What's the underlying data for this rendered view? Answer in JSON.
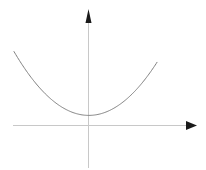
{
  "figure": {
    "title": "",
    "background_color": "#ffffff",
    "width": 206,
    "height": 170
  },
  "chart_data": {
    "type": "line",
    "title": "",
    "xlabel": "",
    "ylabel": "",
    "grid": false,
    "legend": null,
    "function": "y = a(x - h)^2 + k",
    "vertex": {
      "x_px": 87,
      "y_px": 117
    },
    "origin_px": {
      "x": 88,
      "y": 125
    },
    "axis_of_symmetry_px": 86,
    "x": [
      14,
      22,
      30,
      38,
      46,
      54,
      62,
      70,
      78,
      86,
      94,
      102,
      110,
      118,
      126,
      134,
      142,
      150,
      157
    ],
    "y": [
      57,
      66,
      75,
      83,
      91,
      98,
      105,
      110,
      114,
      117,
      117,
      115,
      112,
      107,
      101,
      94,
      85,
      72,
      57
    ],
    "x_px_range": [
      14,
      157
    ],
    "y_px_range": [
      57,
      117
    ],
    "series": [
      {
        "name": "parabola",
        "color": "#808080",
        "line_width": 1,
        "values": [
          57,
          66,
          75,
          83,
          91,
          98,
          105,
          110,
          114,
          117,
          117,
          115,
          112,
          107,
          101,
          94,
          85,
          72,
          57
        ]
      }
    ]
  },
  "axes": {
    "x_axis": {
      "label": "",
      "color": "#c8c8c8",
      "line_width": 1,
      "start_px": {
        "x": 13,
        "y": 125
      },
      "end_px": {
        "x": 189,
        "y": 125
      },
      "arrow": {
        "name": "x-axis-arrowhead",
        "direction": "right",
        "color": "#1a1a1a",
        "tip_px": {
          "x": 197,
          "y": 125
        }
      }
    },
    "y_axis": {
      "label": "",
      "color": "#c8c8c8",
      "line_width": 1,
      "start_px": {
        "x": 88,
        "y": 168
      },
      "end_px": {
        "x": 88,
        "y": 22
      },
      "arrow": {
        "name": "y-axis-arrowhead",
        "direction": "up",
        "color": "#1a1a1a",
        "tip_px": {
          "x": 88,
          "y": 9
        }
      }
    }
  },
  "colors": {
    "curve": "#808080",
    "axis": "#c8c8c8",
    "arrow": "#1a1a1a",
    "background": "#ffffff"
  }
}
